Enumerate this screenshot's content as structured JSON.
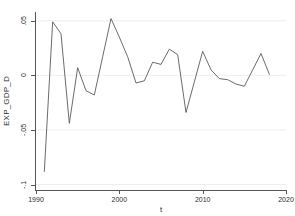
{
  "chart_data": {
    "type": "line",
    "title": "",
    "xlabel": "t",
    "ylabel": "EXP_GDP_D",
    "xlim": [
      1990,
      2020
    ],
    "ylim": [
      -0.105,
      0.058
    ],
    "grid": true,
    "legend": false,
    "legend_position": "none",
    "line_color": "#5a5a5a",
    "xticks": [
      1990,
      2000,
      2010,
      2020
    ],
    "xtick_labels": [
      "1990",
      "2000",
      "2010",
      "2020"
    ],
    "yticks": [
      0.05,
      0,
      -0.05,
      -0.1
    ],
    "ytick_labels": [
      ".05",
      "0",
      "-.05",
      "-.1"
    ],
    "series": [
      {
        "name": "EXP_GDP_D",
        "x": [
          1991,
          1992,
          1993,
          1994,
          1995,
          1996,
          1997,
          1998,
          1999,
          2000,
          2001,
          2002,
          2003,
          2004,
          2005,
          2006,
          2007,
          2008,
          2009,
          2010,
          2011,
          2012,
          2013,
          2014,
          2015,
          2016,
          2017,
          2018
        ],
        "values": [
          -0.088,
          0.049,
          0.038,
          -0.044,
          0.007,
          -0.014,
          -0.018,
          0.017,
          0.052,
          0.035,
          0.017,
          -0.007,
          -0.005,
          0.012,
          0.01,
          0.024,
          0.019,
          -0.034,
          -0.006,
          0.022,
          0.005,
          -0.003,
          -0.004,
          -0.008,
          -0.01,
          0.005,
          0.02,
          0.001
        ]
      }
    ]
  },
  "axes": {
    "y_title": "EXP_GDP_D",
    "x_title": "t"
  }
}
